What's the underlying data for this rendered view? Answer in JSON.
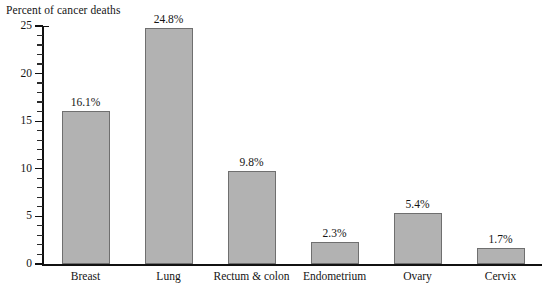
{
  "chart_data": {
    "type": "bar",
    "title": "",
    "ylabel": "Percent of cancer deaths",
    "xlabel": "",
    "ylim": [
      0,
      25
    ],
    "grid": false,
    "legend": "none",
    "y_tick_labels": [
      "0",
      "5",
      "10",
      "15",
      "20",
      "25"
    ],
    "y_ticks": [
      0,
      5,
      10,
      15,
      20,
      25
    ],
    "minor_tick_interval": 1,
    "categories": [
      "Breast",
      "Lung",
      "Rectum & colon",
      "Endometrium",
      "Ovary",
      "Cervix"
    ],
    "values": [
      16.1,
      24.8,
      9.8,
      2.3,
      5.4,
      1.7
    ],
    "value_labels": [
      "16.1%",
      "24.8%",
      "9.8%",
      "2.3%",
      "5.4%",
      "1.7%"
    ],
    "bar_color": "#b2b2b2",
    "bar_border_color": "#6f6f6f",
    "axis_color": "#111111",
    "background_color": "#ffffff"
  }
}
